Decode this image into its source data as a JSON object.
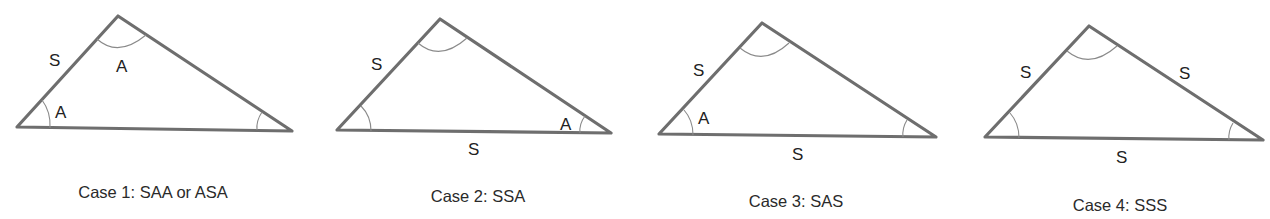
{
  "diagram": {
    "line_color": "#6e6e6e",
    "arc_color": "#8a8a8a",
    "cases": [
      {
        "caption": "Case 1: SAA or ASA",
        "labels": {
          "side_left": "S",
          "angle_top": "A",
          "angle_left": "A"
        }
      },
      {
        "caption": "Case 2: SSA",
        "labels": {
          "side_left": "S",
          "angle_right": "A",
          "side_bottom": "S"
        }
      },
      {
        "caption": "Case 3: SAS",
        "labels": {
          "side_left": "S",
          "angle_left": "A",
          "side_bottom": "S"
        }
      },
      {
        "caption": "Case 4: SSS",
        "labels": {
          "side_left": "S",
          "side_right": "S",
          "side_bottom": "S"
        }
      }
    ]
  }
}
